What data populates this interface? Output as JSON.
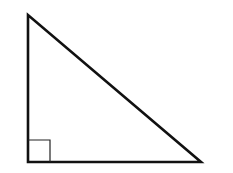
{
  "diagram": {
    "type": "right-triangle",
    "background": "#ffffff",
    "stroke_color": "#111111",
    "vertices": {
      "top": [
        28,
        15
      ],
      "right_angle": [
        28,
        162
      ],
      "bottom_right": [
        201,
        162
      ]
    },
    "right_angle_marker": {
      "x": 28,
      "y": 140,
      "size": 22
    }
  }
}
